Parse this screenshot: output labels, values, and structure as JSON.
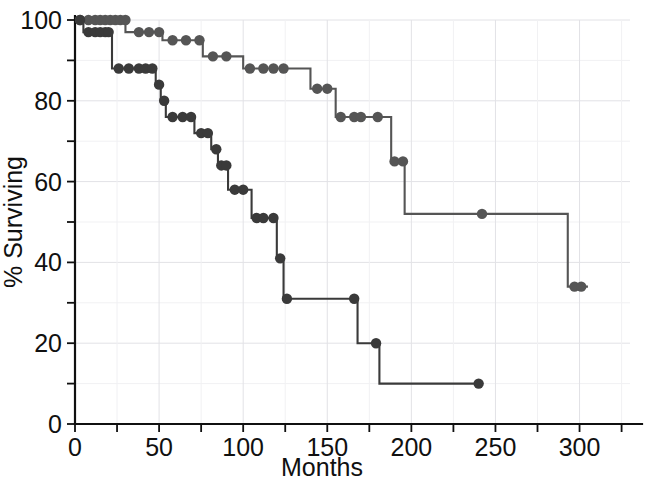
{
  "chart_data": {
    "type": "line",
    "title": "",
    "subtitle": "",
    "xlabel": "Months",
    "ylabel": "% Surviving",
    "xlim": [
      0,
      330
    ],
    "ylim": [
      0,
      100
    ],
    "xticks": [
      0,
      50,
      100,
      150,
      200,
      250,
      300
    ],
    "xtick_labels": [
      "0",
      "50",
      "100",
      "150",
      "200",
      "250",
      "300"
    ],
    "xticks_minor": [
      25,
      75,
      125,
      175,
      225,
      275,
      325
    ],
    "yticks": [
      0,
      20,
      40,
      60,
      80,
      100
    ],
    "ytick_labels": [
      "0",
      "20",
      "40",
      "60",
      "80",
      "100"
    ],
    "yticks_minor": [
      10,
      30,
      50,
      70,
      90
    ],
    "grid": true,
    "legend": "none",
    "style": "kaplan-meier step survival curves",
    "line_color": "#4a4a4a",
    "marker_color": "#4a4a4a",
    "series": [
      {
        "name": "upper-curve",
        "label": "",
        "color": "#555555",
        "steps": [
          {
            "x": 0,
            "y": 100
          },
          {
            "x": 30,
            "y": 100
          },
          {
            "x": 30,
            "y": 97
          },
          {
            "x": 52,
            "y": 97
          },
          {
            "x": 52,
            "y": 95
          },
          {
            "x": 76,
            "y": 95
          },
          {
            "x": 76,
            "y": 91
          },
          {
            "x": 100,
            "y": 91
          },
          {
            "x": 100,
            "y": 88
          },
          {
            "x": 140,
            "y": 88
          },
          {
            "x": 140,
            "y": 83
          },
          {
            "x": 155,
            "y": 83
          },
          {
            "x": 155,
            "y": 76
          },
          {
            "x": 188,
            "y": 76
          },
          {
            "x": 188,
            "y": 65
          },
          {
            "x": 196,
            "y": 65
          },
          {
            "x": 196,
            "y": 52
          },
          {
            "x": 293,
            "y": 52
          },
          {
            "x": 293,
            "y": 34
          },
          {
            "x": 305,
            "y": 34
          }
        ],
        "censored_points": [
          {
            "x": 3,
            "y": 100
          },
          {
            "x": 8,
            "y": 100
          },
          {
            "x": 12,
            "y": 100
          },
          {
            "x": 15,
            "y": 100
          },
          {
            "x": 18,
            "y": 100
          },
          {
            "x": 21,
            "y": 100
          },
          {
            "x": 24,
            "y": 100
          },
          {
            "x": 27,
            "y": 100
          },
          {
            "x": 30,
            "y": 100
          },
          {
            "x": 38,
            "y": 97
          },
          {
            "x": 44,
            "y": 97
          },
          {
            "x": 50,
            "y": 97
          },
          {
            "x": 58,
            "y": 95
          },
          {
            "x": 66,
            "y": 95
          },
          {
            "x": 74,
            "y": 95
          },
          {
            "x": 82,
            "y": 91
          },
          {
            "x": 90,
            "y": 91
          },
          {
            "x": 104,
            "y": 88
          },
          {
            "x": 112,
            "y": 88
          },
          {
            "x": 118,
            "y": 88
          },
          {
            "x": 124,
            "y": 88
          },
          {
            "x": 144,
            "y": 83
          },
          {
            "x": 150,
            "y": 83
          },
          {
            "x": 158,
            "y": 76
          },
          {
            "x": 166,
            "y": 76
          },
          {
            "x": 170,
            "y": 76
          },
          {
            "x": 180,
            "y": 76
          },
          {
            "x": 190,
            "y": 65
          },
          {
            "x": 195,
            "y": 65
          },
          {
            "x": 242,
            "y": 52
          },
          {
            "x": 297,
            "y": 34
          },
          {
            "x": 301,
            "y": 34
          }
        ]
      },
      {
        "name": "lower-curve",
        "label": "",
        "color": "#3a3a3a",
        "steps": [
          {
            "x": 0,
            "y": 100
          },
          {
            "x": 5,
            "y": 100
          },
          {
            "x": 5,
            "y": 97
          },
          {
            "x": 22,
            "y": 97
          },
          {
            "x": 22,
            "y": 88
          },
          {
            "x": 48,
            "y": 88
          },
          {
            "x": 48,
            "y": 84
          },
          {
            "x": 51,
            "y": 84
          },
          {
            "x": 51,
            "y": 80
          },
          {
            "x": 54,
            "y": 80
          },
          {
            "x": 54,
            "y": 76
          },
          {
            "x": 71,
            "y": 76
          },
          {
            "x": 71,
            "y": 72
          },
          {
            "x": 81,
            "y": 72
          },
          {
            "x": 81,
            "y": 68
          },
          {
            "x": 85,
            "y": 68
          },
          {
            "x": 85,
            "y": 64
          },
          {
            "x": 91,
            "y": 64
          },
          {
            "x": 91,
            "y": 58
          },
          {
            "x": 105,
            "y": 58
          },
          {
            "x": 105,
            "y": 51
          },
          {
            "x": 120,
            "y": 51
          },
          {
            "x": 120,
            "y": 41
          },
          {
            "x": 124,
            "y": 41
          },
          {
            "x": 124,
            "y": 31
          },
          {
            "x": 168,
            "y": 31
          },
          {
            "x": 168,
            "y": 20
          },
          {
            "x": 181,
            "y": 20
          },
          {
            "x": 181,
            "y": 10
          },
          {
            "x": 242,
            "y": 10
          }
        ],
        "censored_points": [
          {
            "x": 3,
            "y": 100
          },
          {
            "x": 8,
            "y": 97
          },
          {
            "x": 12,
            "y": 97
          },
          {
            "x": 15,
            "y": 97
          },
          {
            "x": 18,
            "y": 97
          },
          {
            "x": 20,
            "y": 97
          },
          {
            "x": 26,
            "y": 88
          },
          {
            "x": 32,
            "y": 88
          },
          {
            "x": 38,
            "y": 88
          },
          {
            "x": 42,
            "y": 88
          },
          {
            "x": 46,
            "y": 88
          },
          {
            "x": 50,
            "y": 84
          },
          {
            "x": 53,
            "y": 80
          },
          {
            "x": 58,
            "y": 76
          },
          {
            "x": 64,
            "y": 76
          },
          {
            "x": 69,
            "y": 76
          },
          {
            "x": 75,
            "y": 72
          },
          {
            "x": 79,
            "y": 72
          },
          {
            "x": 84,
            "y": 68
          },
          {
            "x": 87,
            "y": 64
          },
          {
            "x": 90,
            "y": 64
          },
          {
            "x": 95,
            "y": 58
          },
          {
            "x": 100,
            "y": 58
          },
          {
            "x": 108,
            "y": 51
          },
          {
            "x": 112,
            "y": 51
          },
          {
            "x": 118,
            "y": 51
          },
          {
            "x": 122,
            "y": 41
          },
          {
            "x": 126,
            "y": 31
          },
          {
            "x": 166,
            "y": 31
          },
          {
            "x": 179,
            "y": 20
          },
          {
            "x": 240,
            "y": 10
          }
        ]
      }
    ]
  },
  "axes": {
    "x_label": "Months",
    "y_label": "% Surviving"
  }
}
